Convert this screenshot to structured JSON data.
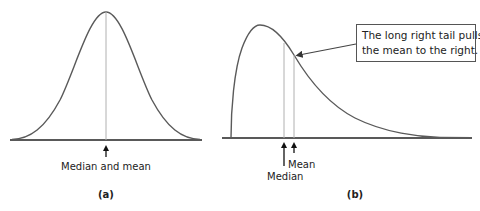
{
  "panels": [
    {
      "id": "a",
      "caption": "(a)",
      "curve_type": "symmetric (normal)",
      "marker_label": "Median and mean"
    },
    {
      "id": "b",
      "caption": "(b)",
      "curve_type": "right-skewed",
      "median_label": "Median",
      "mean_label": "Mean",
      "callout": {
        "line1": "The long right tail pulls",
        "line2": "the mean to the right."
      }
    }
  ],
  "colors": {
    "curve": "#5a5a5a",
    "baseline": "#222222",
    "marker_line": "#b0b0b0",
    "arrow": "#111111",
    "callout_border": "#555555",
    "text": "#222222"
  }
}
